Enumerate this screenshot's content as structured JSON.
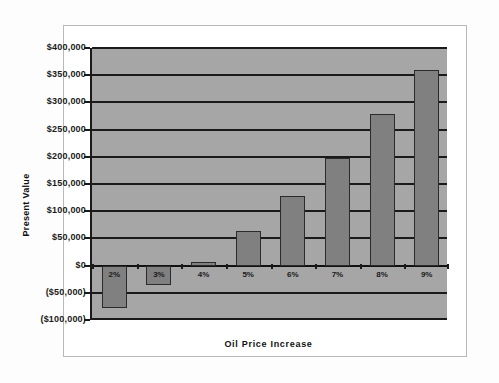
{
  "chart_data": {
    "type": "bar",
    "title": "",
    "xlabel": "Oil Price Increase",
    "ylabel": "Present Value",
    "categories": [
      "2%",
      "3%",
      "4%",
      "5%",
      "6%",
      "7%",
      "8%",
      "9%"
    ],
    "values": [
      -78000,
      -35000,
      7000,
      63000,
      128000,
      197000,
      278000,
      359000
    ],
    "ylim": [
      -100000,
      400000
    ],
    "ytick_values": [
      400000,
      350000,
      300000,
      250000,
      200000,
      150000,
      100000,
      50000,
      0,
      -50000,
      -100000
    ],
    "ytick_labels": [
      "$400,000",
      "$350,000",
      "$300,000",
      "$250,000",
      "$200,000",
      "$150,000",
      "$100,000",
      "$50,000",
      "$0",
      "($50,000)",
      "($100,000)"
    ],
    "grid": true,
    "legend": false,
    "legend_position": "none",
    "colors": {
      "bar_fill": "#808080",
      "bar_edge": "#2b2b2b",
      "plot_background": "#a6a6a6",
      "gridline": "#1a1a1a",
      "axis": "#1a1a1a",
      "card_background": "#ffffff",
      "card_border": "#b9b9b9"
    }
  }
}
